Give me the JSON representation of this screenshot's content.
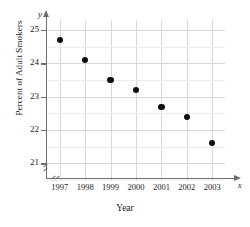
{
  "chart_data": {
    "type": "scatter",
    "title": "",
    "xlabel": "Year",
    "ylabel": "Percent of Adult Smokers",
    "x_axis_variable": "x",
    "y_axis_variable": "y",
    "categories": [
      "1997",
      "1998",
      "1999",
      "2000",
      "2001",
      "2002",
      "2003"
    ],
    "x": [
      1997,
      1998,
      1999,
      2000,
      2001,
      2002,
      2003
    ],
    "values": [
      24.7,
      24.1,
      23.5,
      23.2,
      22.7,
      22.4,
      21.6
    ],
    "xlim": [
      1996.5,
      2003.5
    ],
    "ylim": [
      20.5,
      25.3
    ],
    "y_ticks": [
      "25",
      "24",
      "23",
      "22",
      "21"
    ],
    "y_tick_values": [
      25,
      24,
      23,
      22,
      21
    ],
    "y_minor_step": 0.5,
    "grid": true,
    "legend": false,
    "axis_break": true,
    "marker": "filled-circle",
    "marker_color": "#0d0d0d",
    "grid_color": "#d8d8d8",
    "axis_color": "#6e6e6e",
    "background": "#ffffff"
  }
}
